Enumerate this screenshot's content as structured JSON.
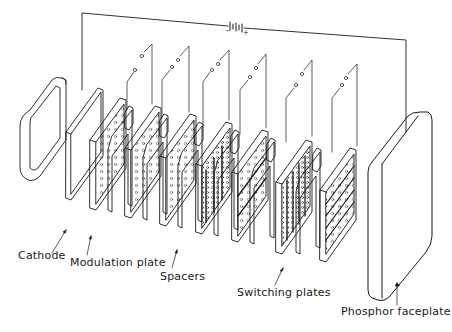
{
  "diagram": {
    "type": "exploded-view",
    "labels": {
      "cathode": "Cathode",
      "modulation_plate": "Modulation plate",
      "spacers": "Spacers",
      "switching_plates": "Switching plates",
      "phosphor_faceplate": "Phosphor faceplate"
    },
    "battery": {
      "minus": "−",
      "plus": "+"
    },
    "components": [
      {
        "id": "cathode-housing",
        "order": 1
      },
      {
        "id": "cathode",
        "order": 2
      },
      {
        "id": "modulation-plate-1",
        "order": 3
      },
      {
        "id": "spacer-1",
        "order": 4
      },
      {
        "id": "modulation-plate-2",
        "order": 5
      },
      {
        "id": "spacer-2",
        "order": 6
      },
      {
        "id": "modulation-plate-3",
        "order": 7
      },
      {
        "id": "spacer-3",
        "order": 8
      },
      {
        "id": "switching-plate-1",
        "order": 9
      },
      {
        "id": "spacer-4",
        "order": 10
      },
      {
        "id": "switching-plate-2",
        "order": 11
      },
      {
        "id": "spacer-5",
        "order": 12
      },
      {
        "id": "switching-plate-3",
        "order": 13
      },
      {
        "id": "spacer-6",
        "order": 14
      },
      {
        "id": "switching-plate-4",
        "order": 15
      },
      {
        "id": "phosphor-faceplate",
        "order": 16
      }
    ],
    "colors": {
      "line": "#1a1a1a",
      "background": "#ffffff"
    }
  }
}
